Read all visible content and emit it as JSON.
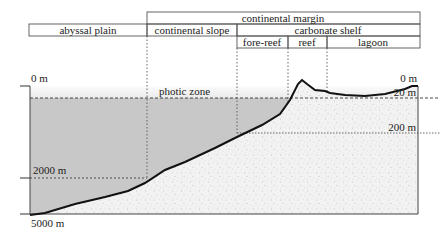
{
  "header": {
    "continental_margin": "continental margin",
    "abyssal_plain": "abyssal plain",
    "continental_slope": "continental slope",
    "carbonate_shelf": "carbonate shelf",
    "fore_reef": "fore-reef",
    "reef": "reef",
    "lagoon": "lagoon"
  },
  "labels": {
    "photic_zone": "photic zone",
    "depth_0_left": "0 m",
    "depth_0_right": "0 m",
    "depth_20": "20 m",
    "depth_200": "200 m",
    "depth_2000": "2000 m",
    "depth_5000": "5000 m"
  },
  "colors": {
    "deep_water": "#c9c9c9",
    "photic_water": "#efefef",
    "sediment": "#f1f1f1",
    "line": "#111111"
  }
}
